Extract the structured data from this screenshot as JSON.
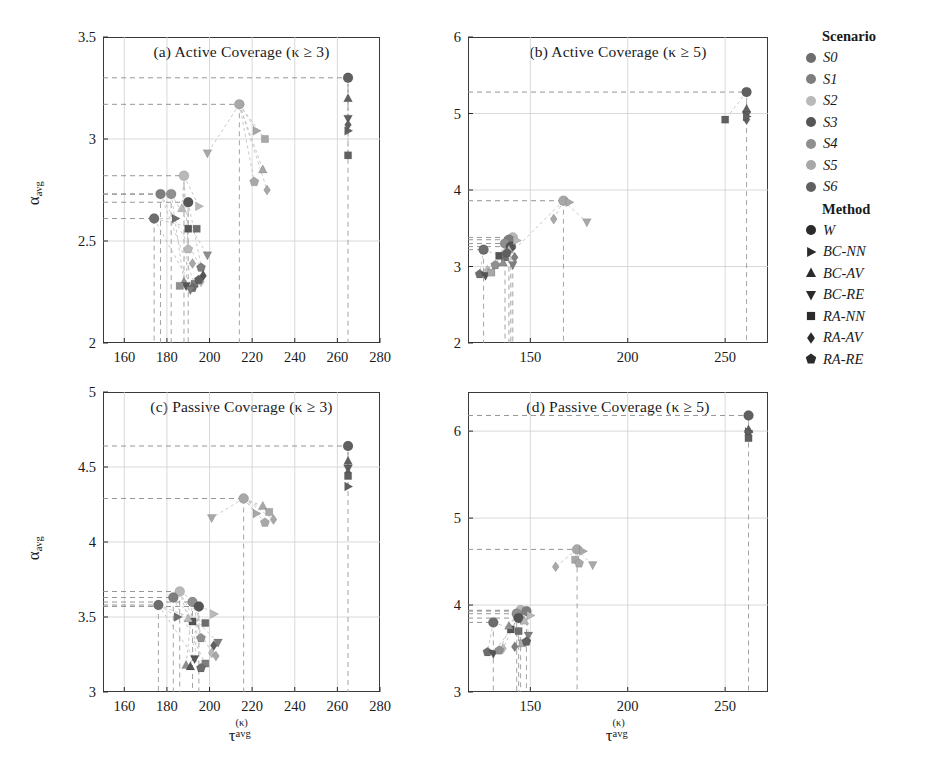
{
  "figure": {
    "axis_labels": {
      "y": "α_avg",
      "x": "τ^(κ)_avg",
      "y_base": "α",
      "y_sub": "avg",
      "x_base": "τ",
      "x_sup": "(κ)",
      "x_sub": "avg"
    }
  },
  "legend": {
    "scenario_title": "Scenario",
    "method_title": "Method",
    "scenarios": [
      {
        "label": "S0",
        "color": "#6d6d6d"
      },
      {
        "label": "S1",
        "color": "#7e7e7e"
      },
      {
        "label": "S2",
        "color": "#b9b9b9"
      },
      {
        "label": "S3",
        "color": "#555555"
      },
      {
        "label": "S4",
        "color": "#8f8f8f"
      },
      {
        "label": "S5",
        "color": "#a8a8a8"
      },
      {
        "label": "S6",
        "color": "#606060"
      }
    ],
    "methods": [
      {
        "label": "W",
        "marker": "circle"
      },
      {
        "label": "BC-NN",
        "marker": "triangle-right"
      },
      {
        "label": "BC-AV",
        "marker": "triangle-up"
      },
      {
        "label": "BC-RE",
        "marker": "triangle-down"
      },
      {
        "label": "RA-NN",
        "marker": "square"
      },
      {
        "label": "RA-AV",
        "marker": "diamond"
      },
      {
        "label": "RA-RE",
        "marker": "pentagon"
      }
    ]
  },
  "chart_data": [
    {
      "id": "a",
      "type": "scatter",
      "title": "(a) Active Coverage (κ ≥ 3)",
      "xlabel": "τ_avg^(κ)",
      "ylabel": "α_avg",
      "xlim": [
        150,
        280
      ],
      "ylim": [
        2,
        3.5
      ],
      "xticks": [
        160,
        180,
        200,
        220,
        240,
        260,
        280
      ],
      "yticks": [
        2,
        2.5,
        3,
        3.5
      ],
      "grid": true,
      "baseline_lines": [
        3.3,
        3.17,
        2.82,
        2.71,
        2.61
      ],
      "points": [
        {
          "scenario": "S6",
          "method": "W",
          "x": 265,
          "y": 3.3
        },
        {
          "scenario": "S6",
          "method": "BC-AV",
          "x": 265,
          "y": 3.2
        },
        {
          "scenario": "S6",
          "method": "BC-RE",
          "x": 265,
          "y": 3.1
        },
        {
          "scenario": "S6",
          "method": "RA-AV",
          "x": 265,
          "y": 3.07
        },
        {
          "scenario": "S6",
          "method": "BC-NN",
          "x": 265,
          "y": 3.04
        },
        {
          "scenario": "S6",
          "method": "RA-NN",
          "x": 265,
          "y": 2.92
        },
        {
          "scenario": "S5",
          "method": "W",
          "x": 214,
          "y": 3.17
        },
        {
          "scenario": "S5",
          "method": "BC-NN",
          "x": 222,
          "y": 3.04
        },
        {
          "scenario": "S5",
          "method": "RA-NN",
          "x": 226,
          "y": 3.0
        },
        {
          "scenario": "S5",
          "method": "BC-AV",
          "x": 225,
          "y": 2.85
        },
        {
          "scenario": "S5",
          "method": "RA-RE",
          "x": 221,
          "y": 2.79
        },
        {
          "scenario": "S5",
          "method": "RA-AV",
          "x": 227,
          "y": 2.75
        },
        {
          "scenario": "S5",
          "method": "BC-RE",
          "x": 199,
          "y": 2.93
        },
        {
          "scenario": "S2",
          "method": "W",
          "x": 188,
          "y": 2.82
        },
        {
          "scenario": "S1",
          "method": "W",
          "x": 177,
          "y": 2.73
        },
        {
          "scenario": "S4",
          "method": "W",
          "x": 182,
          "y": 2.73
        },
        {
          "scenario": "S0",
          "method": "W",
          "x": 174,
          "y": 2.61
        },
        {
          "scenario": "S3",
          "method": "W",
          "x": 190,
          "y": 2.69
        },
        {
          "scenario": "S2",
          "method": "BC-AV",
          "x": 187,
          "y": 2.66
        },
        {
          "scenario": "S2",
          "method": "BC-NN",
          "x": 195,
          "y": 2.67
        },
        {
          "scenario": "S0",
          "method": "BC-NN",
          "x": 184,
          "y": 2.61
        },
        {
          "scenario": "S3",
          "method": "RA-NN",
          "x": 190,
          "y": 2.56
        },
        {
          "scenario": "S0",
          "method": "RA-NN",
          "x": 194,
          "y": 2.56
        },
        {
          "scenario": "S2",
          "method": "RA-RE",
          "x": 190,
          "y": 2.46
        },
        {
          "scenario": "S4",
          "method": "BC-RE",
          "x": 199,
          "y": 2.43
        },
        {
          "scenario": "S5",
          "method": "RA-AV",
          "x": 192,
          "y": 2.39
        },
        {
          "scenario": "S1",
          "method": "RA-RE",
          "x": 196,
          "y": 2.37
        },
        {
          "scenario": "S3",
          "method": "RA-AV",
          "x": 197,
          "y": 2.33
        },
        {
          "scenario": "S4",
          "method": "BC-AV",
          "x": 188,
          "y": 2.3
        },
        {
          "scenario": "S3",
          "method": "BC-RE",
          "x": 189,
          "y": 2.28
        },
        {
          "scenario": "S1",
          "method": "RA-NN",
          "x": 193,
          "y": 2.29
        },
        {
          "scenario": "S2",
          "method": "RA-AV",
          "x": 196,
          "y": 2.3
        },
        {
          "scenario": "S0",
          "method": "RA-RE",
          "x": 192,
          "y": 2.27
        },
        {
          "scenario": "S4",
          "method": "RA-NN",
          "x": 186,
          "y": 2.28
        },
        {
          "scenario": "S1",
          "method": "BC-RE",
          "x": 191,
          "y": 2.26
        },
        {
          "scenario": "S6",
          "method": "RA-RE",
          "x": 195,
          "y": 2.31
        }
      ]
    },
    {
      "id": "b",
      "type": "scatter",
      "title": "(b) Active Coverage (κ ≥ 5)",
      "xlabel": "τ_avg^(κ)",
      "ylabel": "α_avg",
      "xlim": [
        118,
        272
      ],
      "ylim": [
        2,
        6
      ],
      "xticks": [
        150,
        200,
        250
      ],
      "yticks": [
        2,
        3,
        4,
        5,
        6
      ],
      "grid": true,
      "baseline_lines": [
        5.28,
        3.86,
        3.38,
        3.22
      ],
      "points": [
        {
          "scenario": "S6",
          "method": "W",
          "x": 261,
          "y": 5.28
        },
        {
          "scenario": "S6",
          "method": "BC-AV",
          "x": 261,
          "y": 5.06
        },
        {
          "scenario": "S6",
          "method": "BC-RE",
          "x": 261,
          "y": 4.98
        },
        {
          "scenario": "S6",
          "method": "RA-AV",
          "x": 261,
          "y": 4.92
        },
        {
          "scenario": "S6",
          "method": "BC-NN",
          "x": 261,
          "y": 4.96
        },
        {
          "scenario": "S6",
          "method": "RA-NN",
          "x": 250,
          "y": 4.92
        },
        {
          "scenario": "S5",
          "method": "W",
          "x": 167,
          "y": 3.86
        },
        {
          "scenario": "S5",
          "method": "BC-NN",
          "x": 170,
          "y": 3.84
        },
        {
          "scenario": "S5",
          "method": "RA-AV",
          "x": 162,
          "y": 3.62
        },
        {
          "scenario": "S5",
          "method": "BC-RE",
          "x": 179,
          "y": 3.58
        },
        {
          "scenario": "S2",
          "method": "W",
          "x": 141,
          "y": 3.38
        },
        {
          "scenario": "S1",
          "method": "W",
          "x": 139,
          "y": 3.35
        },
        {
          "scenario": "S4",
          "method": "W",
          "x": 137,
          "y": 3.3
        },
        {
          "scenario": "S3",
          "method": "W",
          "x": 140,
          "y": 3.26
        },
        {
          "scenario": "S0",
          "method": "W",
          "x": 126,
          "y": 3.22
        },
        {
          "scenario": "S2",
          "method": "BC-NN",
          "x": 143,
          "y": 3.34
        },
        {
          "scenario": "S2",
          "method": "BC-AV",
          "x": 139,
          "y": 3.22
        },
        {
          "scenario": "S3",
          "method": "RA-NN",
          "x": 134,
          "y": 3.14
        },
        {
          "scenario": "S0",
          "method": "RA-NN",
          "x": 137,
          "y": 3.12
        },
        {
          "scenario": "S4",
          "method": "RA-RE",
          "x": 132,
          "y": 3.02
        },
        {
          "scenario": "S1",
          "method": "BC-RE",
          "x": 141,
          "y": 3.02
        },
        {
          "scenario": "S2",
          "method": "RA-AV",
          "x": 128,
          "y": 2.95
        },
        {
          "scenario": "S0",
          "method": "RA-RE",
          "x": 124,
          "y": 2.9
        },
        {
          "scenario": "S3",
          "method": "BC-RE",
          "x": 127,
          "y": 2.88
        },
        {
          "scenario": "S5",
          "method": "RA-NN",
          "x": 130,
          "y": 2.92
        },
        {
          "scenario": "S4",
          "method": "BC-AV",
          "x": 136,
          "y": 3.05
        },
        {
          "scenario": "S1",
          "method": "RA-AV",
          "x": 142,
          "y": 3.12
        },
        {
          "scenario": "S6",
          "method": "RA-RE",
          "x": 138,
          "y": 3.18
        }
      ]
    },
    {
      "id": "c",
      "type": "scatter",
      "title": "(c) Passive Coverage (κ ≥ 3)",
      "xlabel": "τ_avg^(κ)",
      "ylabel": "α_avg",
      "xlim": [
        150,
        280
      ],
      "ylim": [
        3,
        5
      ],
      "xticks": [
        160,
        180,
        200,
        220,
        240,
        260,
        280
      ],
      "yticks": [
        3,
        3.5,
        4,
        4.5,
        5
      ],
      "grid": true,
      "baseline_lines": [
        4.64,
        4.29,
        3.67,
        3.58,
        3.5
      ],
      "points": [
        {
          "scenario": "S6",
          "method": "W",
          "x": 265,
          "y": 4.64
        },
        {
          "scenario": "S6",
          "method": "BC-AV",
          "x": 265,
          "y": 4.54
        },
        {
          "scenario": "S6",
          "method": "BC-RE",
          "x": 265,
          "y": 4.49
        },
        {
          "scenario": "S6",
          "method": "RA-AV",
          "x": 265,
          "y": 4.46
        },
        {
          "scenario": "S6",
          "method": "RA-NN",
          "x": 265,
          "y": 4.44
        },
        {
          "scenario": "S6",
          "method": "BC-NN",
          "x": 265,
          "y": 4.37
        },
        {
          "scenario": "S5",
          "method": "W",
          "x": 216,
          "y": 4.29
        },
        {
          "scenario": "S5",
          "method": "BC-AV",
          "x": 225,
          "y": 4.24
        },
        {
          "scenario": "S5",
          "method": "RA-NN",
          "x": 228,
          "y": 4.2
        },
        {
          "scenario": "S5",
          "method": "BC-NN",
          "x": 222,
          "y": 4.19
        },
        {
          "scenario": "S5",
          "method": "RA-RE",
          "x": 226,
          "y": 4.13
        },
        {
          "scenario": "S5",
          "method": "RA-AV",
          "x": 230,
          "y": 4.15
        },
        {
          "scenario": "S5",
          "method": "BC-RE",
          "x": 201,
          "y": 4.16
        },
        {
          "scenario": "S2",
          "method": "W",
          "x": 186,
          "y": 3.67
        },
        {
          "scenario": "S1",
          "method": "W",
          "x": 183,
          "y": 3.63
        },
        {
          "scenario": "S0",
          "method": "W",
          "x": 176,
          "y": 3.58
        },
        {
          "scenario": "S4",
          "method": "W",
          "x": 192,
          "y": 3.6
        },
        {
          "scenario": "S3",
          "method": "W",
          "x": 195,
          "y": 3.57
        },
        {
          "scenario": "S2",
          "method": "BC-NN",
          "x": 202,
          "y": 3.52
        },
        {
          "scenario": "S0",
          "method": "BC-NN",
          "x": 185,
          "y": 3.5
        },
        {
          "scenario": "S3",
          "method": "RA-NN",
          "x": 192,
          "y": 3.47
        },
        {
          "scenario": "S0",
          "method": "RA-NN",
          "x": 198,
          "y": 3.46
        },
        {
          "scenario": "S2",
          "method": "BC-AV",
          "x": 190,
          "y": 3.49
        },
        {
          "scenario": "S4",
          "method": "RA-RE",
          "x": 196,
          "y": 3.36
        },
        {
          "scenario": "S1",
          "method": "BC-RE",
          "x": 204,
          "y": 3.33
        },
        {
          "scenario": "S2",
          "method": "RA-AV",
          "x": 201,
          "y": 3.26
        },
        {
          "scenario": "S3",
          "method": "BC-RE",
          "x": 193,
          "y": 3.22
        },
        {
          "scenario": "S4",
          "method": "BC-AV",
          "x": 189,
          "y": 3.18
        },
        {
          "scenario": "S1",
          "method": "RA-NN",
          "x": 198,
          "y": 3.19
        },
        {
          "scenario": "S0",
          "method": "RA-RE",
          "x": 196,
          "y": 3.16
        },
        {
          "scenario": "S5",
          "method": "RA-AV",
          "x": 203,
          "y": 3.24
        },
        {
          "scenario": "S6",
          "method": "RA-AV",
          "x": 202,
          "y": 3.31
        },
        {
          "scenario": "S3",
          "method": "BC-AV",
          "x": 191,
          "y": 3.17
        }
      ]
    },
    {
      "id": "d",
      "type": "scatter",
      "title": "(d) Passive Coverage (κ ≥ 5)",
      "xlabel": "τ_avg^(κ)",
      "ylabel": "α_avg",
      "xlim": [
        118,
        272
      ],
      "ylim": [
        3,
        6.45
      ],
      "xticks": [
        150,
        200,
        250
      ],
      "yticks": [
        3,
        4,
        5,
        6
      ],
      "grid": true,
      "baseline_lines": [
        6.18,
        4.64,
        3.94,
        3.85
      ],
      "points": [
        {
          "scenario": "S6",
          "method": "W",
          "x": 262,
          "y": 6.18
        },
        {
          "scenario": "S6",
          "method": "BC-AV",
          "x": 262,
          "y": 6.02
        },
        {
          "scenario": "S6",
          "method": "BC-RE",
          "x": 262,
          "y": 5.97
        },
        {
          "scenario": "S6",
          "method": "RA-AV",
          "x": 262,
          "y": 5.94
        },
        {
          "scenario": "S6",
          "method": "BC-NN",
          "x": 262,
          "y": 5.99
        },
        {
          "scenario": "S6",
          "method": "RA-NN",
          "x": 262,
          "y": 5.92
        },
        {
          "scenario": "S5",
          "method": "W",
          "x": 174,
          "y": 4.64
        },
        {
          "scenario": "S5",
          "method": "BC-NN",
          "x": 177,
          "y": 4.62
        },
        {
          "scenario": "S5",
          "method": "RA-NN",
          "x": 173,
          "y": 4.52
        },
        {
          "scenario": "S5",
          "method": "RA-RE",
          "x": 175,
          "y": 4.48
        },
        {
          "scenario": "S5",
          "method": "RA-AV",
          "x": 163,
          "y": 4.44
        },
        {
          "scenario": "S5",
          "method": "BC-RE",
          "x": 182,
          "y": 4.46
        },
        {
          "scenario": "S2",
          "method": "W",
          "x": 145,
          "y": 3.94
        },
        {
          "scenario": "S1",
          "method": "W",
          "x": 148,
          "y": 3.93
        },
        {
          "scenario": "S4",
          "method": "W",
          "x": 143,
          "y": 3.9
        },
        {
          "scenario": "S3",
          "method": "W",
          "x": 144,
          "y": 3.85
        },
        {
          "scenario": "S0",
          "method": "W",
          "x": 131,
          "y": 3.8
        },
        {
          "scenario": "S2",
          "method": "BC-NN",
          "x": 150,
          "y": 3.88
        },
        {
          "scenario": "S2",
          "method": "BC-AV",
          "x": 147,
          "y": 3.82
        },
        {
          "scenario": "S3",
          "method": "RA-NN",
          "x": 140,
          "y": 3.72
        },
        {
          "scenario": "S0",
          "method": "RA-NN",
          "x": 144,
          "y": 3.7
        },
        {
          "scenario": "S4",
          "method": "BC-AV",
          "x": 139,
          "y": 3.76
        },
        {
          "scenario": "S1",
          "method": "BC-RE",
          "x": 149,
          "y": 3.65
        },
        {
          "scenario": "S2",
          "method": "RA-AV",
          "x": 136,
          "y": 3.5
        },
        {
          "scenario": "S0",
          "method": "RA-RE",
          "x": 128,
          "y": 3.46
        },
        {
          "scenario": "S3",
          "method": "BC-RE",
          "x": 131,
          "y": 3.44
        },
        {
          "scenario": "S4",
          "method": "RA-RE",
          "x": 134,
          "y": 3.48
        },
        {
          "scenario": "S1",
          "method": "RA-AV",
          "x": 142,
          "y": 3.52
        },
        {
          "scenario": "S5",
          "method": "RA-NN",
          "x": 146,
          "y": 3.56
        },
        {
          "scenario": "S6",
          "method": "RA-RE",
          "x": 148,
          "y": 3.58
        }
      ]
    }
  ]
}
